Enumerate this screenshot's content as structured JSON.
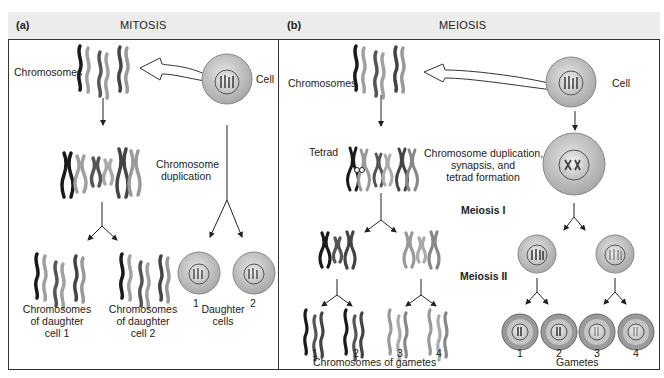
{
  "mitosis": {
    "tag": "(a)",
    "title": "MITOSIS",
    "chromosomes_label": "Chromosomes",
    "cell_label": "Cell",
    "duplication_line1": "Chromosome",
    "duplication_line2": "duplication",
    "daughter1_line1": "Chromosomes",
    "daughter1_line2": "of daughter",
    "daughter1_line3": "cell 1",
    "daughter2_line1": "Chromosomes",
    "daughter2_line2": "of daughter",
    "daughter2_line3": "cell 2",
    "daughter_cells_line1": "Daughter",
    "daughter_cells_line2": "cells",
    "num1": "1",
    "num2": "2"
  },
  "meiosis": {
    "tag": "(b)",
    "title": "MEIOSIS",
    "chromosomes_label": "Chromosomes",
    "cell_label": "Cell",
    "tetrad_label": "Tetrad",
    "duplication_line1": "Chromosome duplication,",
    "duplication_line2": "synapsis, and",
    "duplication_line3": "tetrad formation",
    "meiosis1": "Meiosis I",
    "meiosis2": "Meiosis II",
    "gamete_chrom_nums": [
      "1",
      "2",
      "3",
      "4"
    ],
    "gamete_chrom_label": "Chromosomes of gametes",
    "gamete_nums": [
      "1",
      "2",
      "3",
      "4"
    ],
    "gametes_label": "Gametes"
  },
  "colors": {
    "header_bg": "#ececec",
    "border": "#333333",
    "chrom_dark": "#1a1a1a",
    "chrom_mid": "#666666",
    "chrom_light": "#a0a0a0",
    "cell_outer": "#c8c8c8",
    "cell_inner": "#e4e4e4"
  }
}
